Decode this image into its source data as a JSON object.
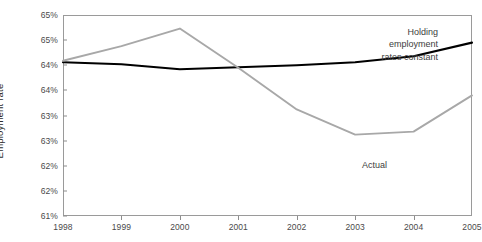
{
  "chart_data": {
    "type": "line",
    "title": "",
    "xlabel": "",
    "ylabel": "Employment rate",
    "x": [
      1998,
      1999,
      2000,
      2001,
      2002,
      2003,
      2004,
      2005
    ],
    "categories": [
      "1998",
      "1999",
      "2000",
      "2001",
      "2002",
      "2003",
      "2004",
      "2005"
    ],
    "xlim": [
      1998,
      2005
    ],
    "ylim": [
      61,
      65
    ],
    "y_tick_values": [
      65,
      64.5,
      64,
      63.5,
      63,
      62.5,
      62,
      61.5,
      61
    ],
    "y_tick_labels": [
      "65%",
      "65%",
      "64%",
      "64%",
      "63%",
      "63%",
      "62%",
      "62%",
      "61%"
    ],
    "grid": false,
    "legend_position": "inline-annotations",
    "series": [
      {
        "name": "Holding employment rates constant",
        "color": "#000000",
        "width": 2.1,
        "values": [
          64.06,
          64.02,
          63.92,
          63.96,
          64.0,
          64.06,
          64.18,
          64.45
        ]
      },
      {
        "name": "Actual",
        "color": "#a8a8a8",
        "width": 1.9,
        "values": [
          64.09,
          64.38,
          64.73,
          63.95,
          63.12,
          62.62,
          62.68,
          63.4
        ]
      }
    ],
    "annotations": [
      {
        "name": "holding-label",
        "lines": [
          "Holding",
          "employment",
          "rates constant"
        ],
        "align": "right"
      },
      {
        "name": "actual-label",
        "text": "Actual"
      }
    ]
  },
  "axis": {
    "y_title": "Employment rate"
  },
  "colors": {
    "series_constant": "#000000",
    "series_actual": "#a8a8a8",
    "frame": "#9a9a9a",
    "text": "#3d3d3d",
    "background": "#ffffff"
  }
}
